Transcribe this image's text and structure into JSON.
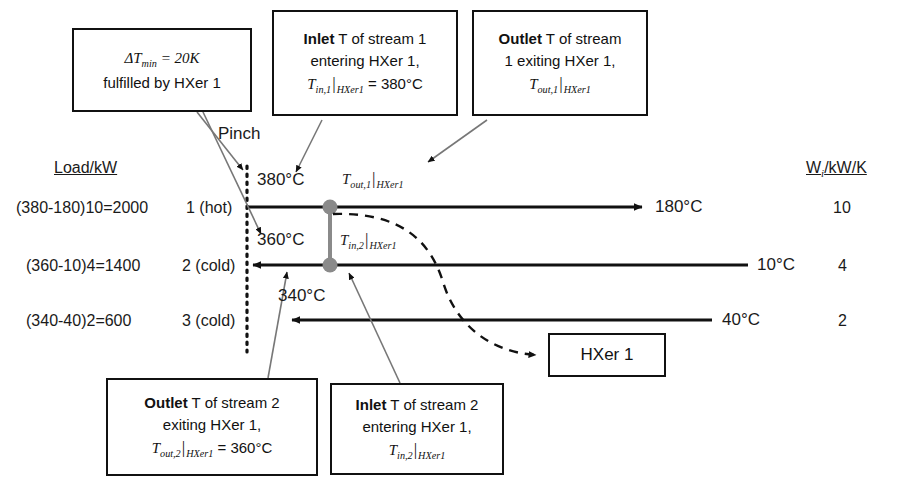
{
  "diagram": {
    "columns": {
      "load_header": "Load/kW",
      "w_header_main": "W",
      "w_header_sub": "i",
      "w_header_rest": "/kW/K"
    },
    "pinch_label": "Pinch",
    "streams": [
      {
        "id": "stream-1",
        "name": "1 (hot)",
        "load": "(380-180)10=2000",
        "inlet_temp": "380°C",
        "outlet_temp": "180°C",
        "w": "10",
        "direction": "left-to-right"
      },
      {
        "id": "stream-2",
        "name": "2 (cold)",
        "load": "(360-10)4=1400",
        "inlet_temp": "10°C",
        "outlet_temp": "360°C",
        "w": "4",
        "direction": "right-to-left"
      },
      {
        "id": "stream-3",
        "name": "3 (cold)",
        "load": "(340-40)2=600",
        "inlet_temp": "40°C",
        "outlet_temp": "340°C",
        "w": "2",
        "direction": "right-to-left"
      }
    ],
    "inline_labels": {
      "t_out_1": {
        "sym": "T",
        "sub": "out,1",
        "sub2": "HXer1"
      },
      "t_in_2": {
        "sym": "T",
        "sub": "in,2",
        "sub2": "HXer1"
      }
    },
    "exchanger": {
      "label": "HXer 1"
    },
    "callouts": [
      {
        "id": "callout-dtmin",
        "line1_math": "ΔT",
        "line1_sub": "min",
        "line1_rest": " = 20K",
        "line2": "fulfilled by HXer 1"
      },
      {
        "id": "callout-inlet-stream1",
        "line1_bold": "Inlet",
        "line1_rest": " T of stream 1",
        "line2": "entering HXer 1,",
        "line3_sym": "T",
        "line3_sub": "in,1",
        "line3_sub2": "HXer1",
        "line3_rest": " = 380°C"
      },
      {
        "id": "callout-outlet-stream1",
        "line1_bold": "Outlet",
        "line1_rest": " T of stream",
        "line2": "1 exiting HXer 1,",
        "line3_sym": "T",
        "line3_sub": "out,1",
        "line3_sub2": "HXer1",
        "line3_rest": ""
      },
      {
        "id": "callout-outlet-stream2",
        "line1_bold": "Outlet",
        "line1_rest": " T of stream 2",
        "line2": "exiting HXer 1,",
        "line3_sym": "T",
        "line3_sub": "out,2",
        "line3_sub2": "HXer1",
        "line3_rest": " = 360°C"
      },
      {
        "id": "callout-inlet-stream2",
        "line1_bold": "Inlet",
        "line1_rest": " T of stream 2",
        "line2": "entering HXer 1,",
        "line3_sym": "T",
        "line3_sub": "in,2",
        "line3_sub2": "HXer1",
        "line3_rest": ""
      }
    ],
    "colors": {
      "stroke": "#111111",
      "node": "#808080",
      "connector": "#666666",
      "background": "#ffffff"
    }
  }
}
